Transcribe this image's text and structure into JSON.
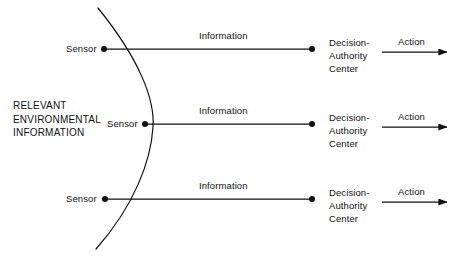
{
  "diagram": {
    "env_block": {
      "lines": [
        "RELEVANT",
        "ENVIRONMENTAL",
        "INFORMATION"
      ],
      "x": 13,
      "y": 99
    },
    "boundary_curve": {
      "name": "environment-boundary-arc",
      "color": "#111111",
      "width": 1.2,
      "path": "M 98 8 C 140 60, 155 100, 153 127 C 151 160, 135 205, 96 249"
    },
    "rows": [
      {
        "sensor_label": "Sensor",
        "sensor_label_x": 66,
        "information_label": "Information",
        "information_label_x": 199,
        "decision_lines": [
          "Decision-",
          "Authority",
          "Center"
        ],
        "decision_x": 329,
        "action_label": "Action",
        "action_label_x": 398,
        "y": 49,
        "dot_left_x": 104,
        "dot_right_x": 312,
        "arrow_x1": 382,
        "arrow_x2": 447,
        "arrow_y": 52
      },
      {
        "sensor_label": "Sensor",
        "sensor_label_x": 107,
        "information_label": "Information",
        "information_label_x": 199,
        "decision_lines": [
          "Decision-",
          "Authority",
          "Center"
        ],
        "decision_x": 329,
        "action_label": "Action",
        "action_label_x": 398,
        "y": 124,
        "dot_left_x": 145,
        "dot_right_x": 312,
        "arrow_x1": 382,
        "arrow_x2": 447,
        "arrow_y": 127
      },
      {
        "sensor_label": "Sensor",
        "sensor_label_x": 66,
        "information_label": "Information",
        "information_label_x": 199,
        "decision_lines": [
          "Decision-",
          "Authority",
          "Center"
        ],
        "decision_x": 329,
        "action_label": "Action",
        "action_label_x": 398,
        "y": 199,
        "dot_left_x": 105,
        "dot_right_x": 312,
        "arrow_x1": 382,
        "arrow_x2": 447,
        "arrow_y": 202
      }
    ],
    "colors": {
      "line": "#111111",
      "text": "#111111",
      "background": "#ffffff"
    }
  }
}
